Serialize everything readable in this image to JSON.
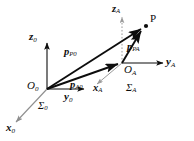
{
  "figure": {
    "type": "vector-diagram",
    "background_color": "#ffffff",
    "stroke_color": "#0d0d0d",
    "dim_color": "#9a9a9a"
  },
  "points": {
    "origin0": {
      "label_main": "O",
      "label_sub": "0",
      "x": 47,
      "y": 89
    },
    "originA": {
      "label_main": "O",
      "label_sub": "A",
      "x": 122,
      "y": 63
    },
    "pointP": {
      "label_main": "P",
      "label_sub": "",
      "x": 146,
      "y": 26
    }
  },
  "frames": [
    {
      "name": "frame-0",
      "sigma_main": "Σ",
      "sigma_sub": "0",
      "axes": [
        {
          "name": "z0",
          "main": "z",
          "sub": "0",
          "dir": "up",
          "dashed": false
        },
        {
          "name": "y0",
          "main": "y",
          "sub": "0",
          "dir": "right",
          "dashed": false
        },
        {
          "name": "x0",
          "main": "x",
          "sub": "0",
          "dir": "down-left",
          "dashed": false
        }
      ]
    },
    {
      "name": "frame-A",
      "sigma_main": "Σ",
      "sigma_sub": "A",
      "axes": [
        {
          "name": "zA",
          "main": "z",
          "sub": "A",
          "dir": "up",
          "dashed": true
        },
        {
          "name": "yA",
          "main": "y",
          "sub": "A",
          "dir": "right",
          "dashed": false
        },
        {
          "name": "xA",
          "main": "x",
          "sub": "A",
          "dir": "down-left",
          "dashed": false
        }
      ]
    }
  ],
  "vectors": [
    {
      "name": "p-P0",
      "main": "p",
      "sub": "P0",
      "from": "origin0",
      "to": "pointP"
    },
    {
      "name": "p-A0",
      "main": "p",
      "sub": "A0",
      "from": "origin0",
      "to": "originA"
    },
    {
      "name": "p-PA",
      "main": "p",
      "sub": "PA",
      "from": "originA",
      "to": "pointP"
    }
  ],
  "labels": {
    "z0": {
      "main": "z",
      "sub": "0"
    },
    "y0": {
      "main": "y",
      "sub": "0"
    },
    "x0": {
      "main": "x",
      "sub": "0"
    },
    "O0": {
      "main": "O",
      "sub": "0"
    },
    "S0": {
      "main": "Σ",
      "sub": "0"
    },
    "zA": {
      "main": "z",
      "sub": "A"
    },
    "yA": {
      "main": "y",
      "sub": "A"
    },
    "xA": {
      "main": "x",
      "sub": "A"
    },
    "OA": {
      "main": "O",
      "sub": "A"
    },
    "SA": {
      "main": "Σ",
      "sub": "A"
    },
    "P": {
      "main": "P",
      "sub": ""
    },
    "pP0": {
      "main": "p",
      "sub": "P0"
    },
    "pA0": {
      "main": "p",
      "sub": "A0"
    },
    "pPA": {
      "main": "p",
      "sub": "PA"
    }
  }
}
